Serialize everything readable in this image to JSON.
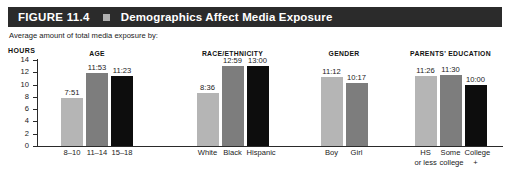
{
  "header": {
    "figure_number": "FIGURE 11.4",
    "square_icon": "square-icon",
    "title": "Demographics Affect Media Exposure",
    "bar_color": "#2b2b2b",
    "text_color": "#ffffff"
  },
  "subtitle": "Average amount of total media exposure by:",
  "chart_data": {
    "type": "bar",
    "title": "Demographics Affect Media Exposure",
    "subtitle": "Average amount of total media exposure by:",
    "xlabel": "",
    "ylabel": "HOURS",
    "ylim": [
      0,
      14
    ],
    "yticks": [
      0,
      2,
      4,
      6,
      8,
      10,
      12,
      14
    ],
    "ytick_labels": [
      "0",
      "2",
      "4",
      "6",
      "8",
      "10",
      "12",
      "14"
    ],
    "grid": false,
    "legend": "none",
    "value_format": "hours:minutes",
    "palette": {
      "light": "#b5b5b5",
      "medium": "#7d7d7d",
      "dark": "#0d0d0d"
    },
    "groups": [
      {
        "name": "AGE",
        "categories": [
          "8–10",
          "11–14",
          "15–18"
        ],
        "labels": [
          [
            "8–10"
          ],
          [
            "11–14"
          ],
          [
            "15–18"
          ]
        ],
        "display_values": [
          "7:51",
          "11:53",
          "11:23"
        ],
        "values": [
          7.85,
          11.88,
          11.38
        ],
        "colors": [
          "#b5b5b5",
          "#7d7d7d",
          "#0d0d0d"
        ]
      },
      {
        "name": "RACE/ETHNICITY",
        "categories": [
          "White",
          "Black",
          "Hispanic"
        ],
        "labels": [
          [
            "White"
          ],
          [
            "Black"
          ],
          [
            "Hispanic"
          ]
        ],
        "display_values": [
          "8:36",
          "12:59",
          "13:00"
        ],
        "values": [
          8.6,
          12.98,
          13.0
        ],
        "colors": [
          "#b5b5b5",
          "#7d7d7d",
          "#0d0d0d"
        ]
      },
      {
        "name": "GENDER",
        "categories": [
          "Boy",
          "Girl"
        ],
        "labels": [
          [
            "Boy"
          ],
          [
            "Girl"
          ]
        ],
        "display_values": [
          "11:12",
          "10:17"
        ],
        "values": [
          11.2,
          10.28
        ],
        "colors": [
          "#b5b5b5",
          "#7d7d7d"
        ]
      },
      {
        "name": "PARENTS' EDUCATION",
        "categories": [
          "HS or less",
          "Some college",
          "College +"
        ],
        "labels": [
          [
            "HS",
            "or less"
          ],
          [
            "Some",
            "college"
          ],
          [
            "College",
            "+"
          ]
        ],
        "display_values": [
          "11:26",
          "11:30",
          "10:00"
        ],
        "values": [
          11.43,
          11.5,
          10.0
        ],
        "colors": [
          "#b5b5b5",
          "#7d7d7d",
          "#0d0d0d"
        ]
      }
    ]
  }
}
